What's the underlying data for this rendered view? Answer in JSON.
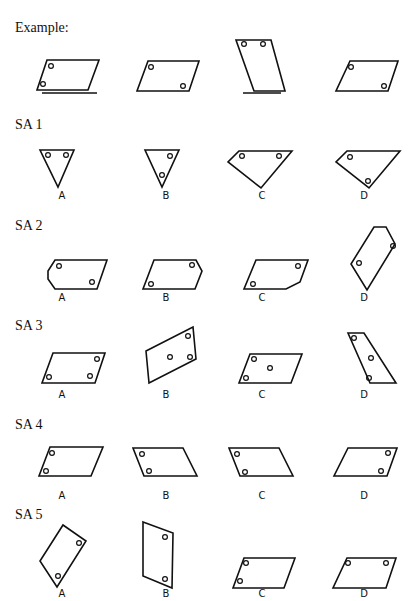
{
  "example": {
    "label": "Example:",
    "shapes": [
      {
        "points": "47,60 99,60 88,90 37,90",
        "dots": [
          [
            51,
            66
          ],
          [
            43,
            84
          ]
        ],
        "base": [
          42,
          97,
          93
        ]
      },
      {
        "points": "148,61 199,61 189,91 137,91",
        "dots": [
          [
            151,
            67
          ],
          [
            183,
            86
          ]
        ]
      },
      {
        "points": "236,40 271,40 285,91 254,91",
        "dots": [
          [
            244,
            44
          ],
          [
            263,
            44
          ]
        ],
        "base": [
          243,
          281,
          93
        ]
      },
      {
        "points": "350,61 398,61 388,91 336,91",
        "dots": [
          [
            351,
            67
          ],
          [
            384,
            86
          ]
        ]
      }
    ]
  },
  "items": [
    {
      "label": "SA 1",
      "label_y": 114,
      "letter_y": 199,
      "options": [
        {
          "letter": "A",
          "points": "40,150 74,150 58,187",
          "dots": [
            [
              48,
              155
            ],
            [
              66,
              155
            ]
          ]
        },
        {
          "letter": "B",
          "points": "145,150 179,150 162,187",
          "dots": [
            [
              170,
              156
            ],
            [
              162,
              175
            ]
          ]
        },
        {
          "letter": "C",
          "points": "239,151 292,151 261,188 228,162",
          "dots": [
            [
              242,
              156
            ],
            [
              279,
              156
            ]
          ]
        },
        {
          "letter": "D",
          "points": "347,151 400,151 369,188 336,162",
          "dots": [
            [
              350,
              157
            ],
            [
              368,
              181
            ]
          ]
        }
      ]
    },
    {
      "label": "SA 2",
      "label_y": 216,
      "letter_y": 301,
      "options": [
        {
          "letter": "A",
          "points": "55,260 107,260 97,289 55,289 48,279 48,271",
          "dots": [
            [
              59,
              266
            ],
            [
              92,
              282
            ]
          ]
        },
        {
          "letter": "B",
          "points": "154,260 196,260 202,271 195,289 143,289",
          "dots": [
            [
              192,
              265
            ],
            [
              151,
              284
            ]
          ]
        },
        {
          "letter": "C",
          "points": "256,260 308,260 300,282 286,289 244,289",
          "dots": [
            [
              298,
              266
            ],
            [
              253,
              284
            ]
          ]
        },
        {
          "letter": "D",
          "points": "374,227 386,227 395,244 367,290 351,264",
          "dots": [
            [
              393,
              246
            ],
            [
              359,
              263
            ]
          ]
        }
      ]
    },
    {
      "label": "SA 3",
      "label_y": 316,
      "letter_y": 398,
      "options": [
        {
          "letter": "A",
          "points": "53,353 105,353 95,383 42,383",
          "dots": [
            [
              97,
              359
            ],
            [
              49,
              377
            ],
            [
              90,
              376
            ]
          ]
        },
        {
          "letter": "B",
          "points": "146,351 193,327 196,359 149,383",
          "dots": [
            [
              188,
              336
            ],
            [
              170,
              357
            ],
            [
              190,
              357
            ]
          ]
        },
        {
          "letter": "C",
          "points": "250,354 302,354 291,383 239,383",
          "dots": [
            [
              254,
              359
            ],
            [
              270,
              368
            ],
            [
              246,
              378
            ]
          ]
        },
        {
          "letter": "D",
          "points": "348,333 364,333 396,383 370,383",
          "dots": [
            [
              354,
              338
            ],
            [
              371,
              358
            ],
            [
              369,
              378
            ]
          ]
        }
      ]
    },
    {
      "label": "SA 4",
      "label_y": 415,
      "letter_y": 499,
      "options": [
        {
          "letter": "A",
          "points": "50,447 103,447 91,476 39,476",
          "dots": [
            [
              52,
              453
            ],
            [
              46,
              471
            ]
          ]
        },
        {
          "letter": "B",
          "points": "133,448 183,448 197,476 144,476",
          "dots": [
            [
              142,
              454
            ],
            [
              149,
              471
            ]
          ]
        },
        {
          "letter": "C",
          "points": "229,448 279,448 293,476 240,476",
          "dots": [
            [
              237,
              454
            ],
            [
              245,
              472
            ]
          ]
        },
        {
          "letter": "D",
          "points": "348,448 397,448 387,476 334,476",
          "dots": [
            [
              388,
              453
            ],
            [
              381,
              471
            ]
          ]
        }
      ]
    },
    {
      "label": "SA 5",
      "label_y": 506,
      "letter_y": 597,
      "options": [
        {
          "letter": "A",
          "points": "63,525 86,541 57,587 40,561",
          "dots": [
            [
              79,
              543
            ],
            [
              58,
              576
            ]
          ]
        },
        {
          "letter": "B",
          "points": "143,522 173,533 172,588 143,576",
          "dots": [
            [
              165,
              537
            ],
            [
              165,
              579
            ]
          ]
        },
        {
          "letter": "C",
          "points": "244,558 295,558 284,588 233,588",
          "dots": [
            [
              246,
              563
            ],
            [
              240,
              581
            ]
          ]
        },
        {
          "letter": "D",
          "points": "347,558 396,558 386,588 333,588",
          "dots": [
            [
              348,
              563
            ],
            [
              386,
              563
            ]
          ]
        }
      ]
    }
  ],
  "option_x": [
    62,
    166,
    262,
    364
  ]
}
